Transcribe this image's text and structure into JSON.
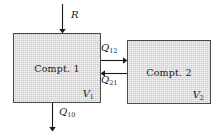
{
  "diagram": {
    "compartments": [
      {
        "id": "compartment-1",
        "label": "Compt. 1",
        "volume_symbol": "V",
        "volume_subscript": "1"
      },
      {
        "id": "compartment-2",
        "label": "Compt. 2",
        "volume_symbol": "V",
        "volume_subscript": "2"
      }
    ],
    "flows": [
      {
        "id": "input-rate",
        "symbol": "R",
        "subscript": "",
        "direction": "down",
        "from": "external",
        "to": "compartment-1"
      },
      {
        "id": "flow-1-to-2",
        "symbol": "Q",
        "subscript": "12",
        "direction": "right",
        "from": "compartment-1",
        "to": "compartment-2"
      },
      {
        "id": "flow-2-to-1",
        "symbol": "Q",
        "subscript": "21",
        "direction": "left",
        "from": "compartment-2",
        "to": "compartment-1"
      },
      {
        "id": "elimination",
        "symbol": "Q",
        "subscript": "10",
        "direction": "down",
        "from": "compartment-1",
        "to": "external"
      }
    ],
    "colors": {
      "box_fill": "#c9c9c9",
      "box_border": "#4a4a4a",
      "line": "#1a1a1a",
      "background": "#ffffff"
    }
  }
}
